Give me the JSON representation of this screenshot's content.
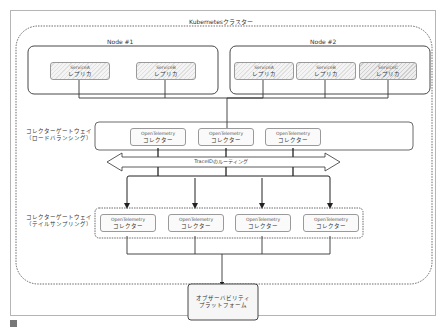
{
  "cluster": {
    "title": "Kubernetesクラスター"
  },
  "nodes": [
    {
      "title": "Node #1",
      "services": [
        {
          "name": "ServiceA",
          "sub": "レプリカ"
        },
        {
          "name": "ServiceB",
          "sub": "レプリカ"
        }
      ]
    },
    {
      "title": "Node #2",
      "services": [
        {
          "name": "ServiceA",
          "sub": "レプリカ"
        },
        {
          "name": "ServiceB",
          "sub": "レプリカ"
        },
        {
          "name": "ServiceC",
          "sub": "レプリカ"
        }
      ]
    }
  ],
  "gateway_lb": {
    "label_line1": "コレクターゲートウェイ",
    "label_line2": "（ロードバランシング）",
    "collectors": [
      {
        "name": "OpenTelemetry",
        "sub": "コレクター"
      },
      {
        "name": "OpenTelemetry",
        "sub": "コレクター"
      },
      {
        "name": "OpenTelemetry",
        "sub": "コレクター"
      }
    ]
  },
  "routing": {
    "label": "TraceIDのルーティング"
  },
  "gateway_ts": {
    "label_line1": "コレクターゲートウェイ",
    "label_line2": "（テイルサンプリング）",
    "collectors": [
      {
        "name": "OpenTelemetry",
        "sub": "コレクター"
      },
      {
        "name": "OpenTelemetry",
        "sub": "コレクター"
      },
      {
        "name": "OpenTelemetry",
        "sub": "コレクター"
      },
      {
        "name": "OpenTelemetry",
        "sub": "コレクター"
      }
    ]
  },
  "platform": {
    "line1": "オブザーバビリティ",
    "line2": "プラットフォーム"
  }
}
